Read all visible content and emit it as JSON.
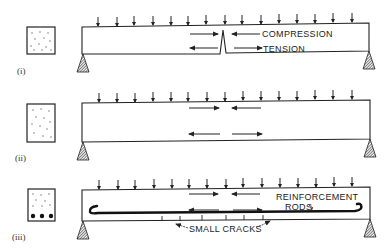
{
  "colors": {
    "ink": "#222222",
    "paper": "#ffffff"
  },
  "panels": [
    {
      "id": "i",
      "label": "(i)",
      "description": "Plain beam under load, cracked at midspan",
      "annotations": [
        "COMPRESSION",
        "TENSION"
      ],
      "cross_section": "plain concrete (no rods)"
    },
    {
      "id": "ii",
      "label": "(ii)",
      "description": "Deeper plain beam under load with compression and tension arrows",
      "annotations": [],
      "cross_section": "plain concrete (no rods)"
    },
    {
      "id": "iii",
      "label": "(iii)",
      "description": "Reinforced beam with steel rods near the bottom",
      "annotations": [
        "REINFORCEMENT",
        "RODS",
        "SMALL CRACKS"
      ],
      "cross_section": "concrete with 3 reinforcement rods"
    }
  ],
  "text": {
    "p1_label": "(i)",
    "p2_label": "(ii)",
    "p3_label": "(iii)",
    "compression": "COMPRESSION",
    "tension": "TENSION",
    "reinforcement": "REINFORCEMENT",
    "rods": "RODS",
    "small_cracks": "SMALL CRACKS"
  }
}
